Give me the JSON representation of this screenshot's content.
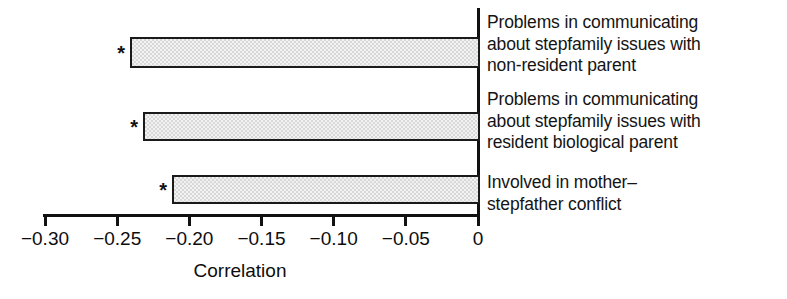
{
  "chart_data": {
    "type": "bar",
    "orientation": "horizontal",
    "title": "",
    "subtitle": "",
    "xlabel": "Correlation",
    "ylabel": "",
    "xlim": [
      -0.3,
      0.0
    ],
    "grid": false,
    "legend": null,
    "categories": [
      "Problems in communicating\nabout stepfamily issues with\nnon-resident parent",
      "Problems in communicating\nabout stepfamily issues with\nresident biological parent",
      "Involved in mother–\nstepfather conflict"
    ],
    "values": [
      -0.241,
      -0.232,
      -0.212
    ],
    "annotations": [
      "*",
      "*",
      "*"
    ],
    "annotation_meaning": "statistically significant",
    "xticks": [
      -0.3,
      -0.25,
      -0.2,
      -0.15,
      -0.1,
      -0.05,
      0
    ],
    "xticklabels": [
      "−0.30",
      "−0.25",
      "−0.20",
      "−0.15",
      "−0.10",
      "−0.05",
      "0"
    ],
    "bar_fill_color": "#d8d8d8",
    "bar_edge_color": "#1a1a1a",
    "axis_color": "#111111"
  },
  "geometry": {
    "zero_x_px": 478,
    "px_per_unit": 1443.3,
    "bars": [
      {
        "top_px": 37,
        "height_px": 31
      },
      {
        "top_px": 112,
        "height_px": 29
      },
      {
        "top_px": 175,
        "height_px": 29
      }
    ],
    "label_tops": [
      12,
      89,
      172
    ]
  }
}
